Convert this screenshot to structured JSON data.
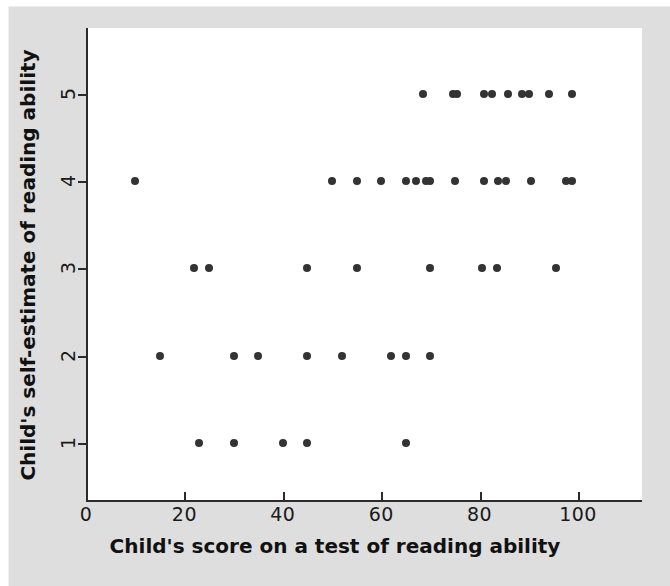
{
  "figure": {
    "background_color": "#dedede",
    "plot_background_color": "#ffffff",
    "axis_color": "#2b2b2b",
    "point_color": "#333333"
  },
  "chart_data": {
    "type": "scatter",
    "title": "",
    "xlabel": "Child's score on a test of reading ability",
    "ylabel": "Child's self-estimate of reading ability",
    "xlim": [
      0,
      113
    ],
    "ylim": [
      0.35,
      5.75
    ],
    "xticks": [
      0,
      20,
      40,
      60,
      80,
      100
    ],
    "xticklabels": [
      "0",
      "20",
      "40",
      "60",
      "80",
      "100"
    ],
    "yticks": [
      1,
      2,
      3,
      4,
      5
    ],
    "yticklabels": [
      "1",
      "2",
      "3",
      "4",
      "5"
    ],
    "grid": false,
    "legend": null,
    "marker": "circle",
    "points": [
      {
        "x": 10,
        "y": 4
      },
      {
        "x": 15,
        "y": 2
      },
      {
        "x": 22,
        "y": 3
      },
      {
        "x": 23,
        "y": 1
      },
      {
        "x": 25,
        "y": 3
      },
      {
        "x": 30,
        "y": 1
      },
      {
        "x": 30,
        "y": 2
      },
      {
        "x": 35,
        "y": 2
      },
      {
        "x": 40,
        "y": 1
      },
      {
        "x": 45,
        "y": 1
      },
      {
        "x": 45,
        "y": 2
      },
      {
        "x": 45,
        "y": 3
      },
      {
        "x": 50,
        "y": 4
      },
      {
        "x": 52,
        "y": 2
      },
      {
        "x": 55,
        "y": 3
      },
      {
        "x": 55,
        "y": 4
      },
      {
        "x": 60,
        "y": 4
      },
      {
        "x": 62,
        "y": 2
      },
      {
        "x": 65,
        "y": 1
      },
      {
        "x": 65,
        "y": 2
      },
      {
        "x": 65,
        "y": 4
      },
      {
        "x": 67,
        "y": 4
      },
      {
        "x": 68.5,
        "y": 5
      },
      {
        "x": 69,
        "y": 4
      },
      {
        "x": 70,
        "y": 2
      },
      {
        "x": 70,
        "y": 3
      },
      {
        "x": 70,
        "y": 4
      },
      {
        "x": 74.5,
        "y": 5
      },
      {
        "x": 75.5,
        "y": 5
      },
      {
        "x": 75,
        "y": 4
      },
      {
        "x": 80.5,
        "y": 3
      },
      {
        "x": 80.8,
        "y": 4
      },
      {
        "x": 80.8,
        "y": 5
      },
      {
        "x": 82.5,
        "y": 5
      },
      {
        "x": 83.6,
        "y": 3
      },
      {
        "x": 83.8,
        "y": 4
      },
      {
        "x": 85.3,
        "y": 4
      },
      {
        "x": 85.7,
        "y": 5
      },
      {
        "x": 88.7,
        "y": 5
      },
      {
        "x": 90,
        "y": 5
      },
      {
        "x": 90.4,
        "y": 4
      },
      {
        "x": 94,
        "y": 5
      },
      {
        "x": 95.5,
        "y": 3
      },
      {
        "x": 97.6,
        "y": 4
      },
      {
        "x": 98.7,
        "y": 4
      },
      {
        "x": 98.7,
        "y": 5
      }
    ]
  }
}
